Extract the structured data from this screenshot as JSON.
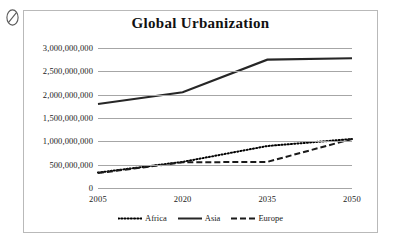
{
  "marks": {
    "null_symbol": "null-slash-mark"
  },
  "chart_data": {
    "type": "line",
    "title": "Global Urbanization",
    "xlabel": "",
    "ylabel": "",
    "categories": [
      "2005",
      "2020",
      "2035",
      "2050"
    ],
    "ylim": [
      0,
      3000000000
    ],
    "yticks": [
      0,
      500000000,
      1000000000,
      1500000000,
      2000000000,
      2500000000,
      3000000000
    ],
    "ytick_labels": [
      "0",
      "500,000,000",
      "1,000,000,000",
      "1,500,000,000",
      "2,000,000,000",
      "2,500,000,000",
      "3,000,000,000"
    ],
    "grid": true,
    "legend_position": "bottom",
    "series": [
      {
        "name": "Africa",
        "style": "dotted",
        "color": "#000000",
        "values": [
          330000000,
          560000000,
          900000000,
          1050000000
        ]
      },
      {
        "name": "Asia",
        "style": "solid",
        "color": "#262626",
        "values": [
          1800000000,
          2050000000,
          2750000000,
          2780000000
        ]
      },
      {
        "name": "Europe",
        "style": "dashed",
        "color": "#1a1a1a",
        "values": [
          320000000,
          550000000,
          560000000,
          1050000000
        ]
      }
    ]
  }
}
